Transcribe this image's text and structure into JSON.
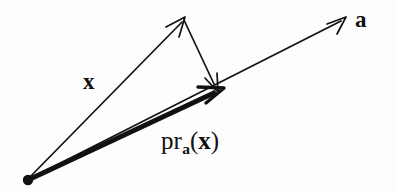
{
  "figure": {
    "kind": "vector-projection-diagram",
    "title_text": "",
    "background_color": "#fdfdfd",
    "ink_color": "#111111",
    "width": 397,
    "height": 192,
    "origin": {
      "x": 27,
      "y": 180,
      "dot_radius": 5
    },
    "labels": {
      "a": "a",
      "x": "x",
      "projection": {
        "operator": "pr",
        "subscript": "a",
        "open_paren": "(",
        "argument": "x",
        "close_paren": ")",
        "full_text": "pr_a(x)"
      }
    },
    "vectors": [
      {
        "name": "x",
        "label": "x",
        "style": "thin",
        "stroke_width": 1.6,
        "from": {
          "x": 27,
          "y": 180
        },
        "to": {
          "x": 185,
          "y": 18
        },
        "arrowhead": "open",
        "label_position": {
          "x": 92,
          "y": 82
        }
      },
      {
        "name": "a",
        "label": "a",
        "style": "thin",
        "stroke_width": 1.6,
        "from": {
          "x": 27,
          "y": 180
        },
        "to": {
          "x": 346,
          "y": 18
        },
        "arrowhead": "open",
        "label_position": {
          "x": 366,
          "y": 20
        }
      },
      {
        "name": "pr_a(x)",
        "label": "pr_a(x)",
        "style": "thick",
        "stroke_width": 5,
        "from": {
          "x": 27,
          "y": 180
        },
        "to": {
          "x": 222,
          "y": 89
        },
        "arrowhead": "open",
        "label_position": {
          "x": 200,
          "y": 145
        }
      },
      {
        "name": "residual",
        "label": "",
        "style": "thin",
        "stroke_width": 1.6,
        "from": {
          "x": 185,
          "y": 18
        },
        "to": {
          "x": 218,
          "y": 90
        },
        "arrowhead": "open",
        "label_position": null
      }
    ]
  }
}
